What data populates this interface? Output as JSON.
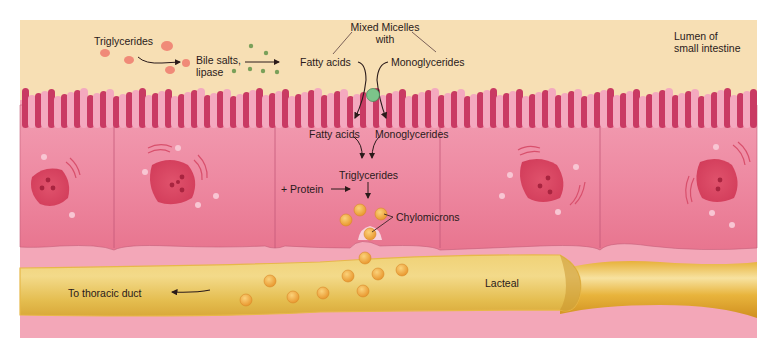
{
  "diagram": {
    "regions": {
      "lumen": {
        "label": "Lumen of\nsmall intestine",
        "line1": "Lumen of",
        "line2": "small intestine",
        "color": "#f7dfb4"
      },
      "epithelium": {
        "color": "#ef8aa0",
        "villi_dark": "#c93a63",
        "villi_light": "#f4a9bf"
      },
      "lamina": {
        "color": "#f3a7b8"
      },
      "lacteal": {
        "label": "Lacteal",
        "color": "#eccb62",
        "edge": "#d9a93a"
      }
    },
    "labels": {
      "triglycerides_lumen": "Triglycerides",
      "bile_salts_line1": "Bile salts,",
      "bile_salts_line2": "lipase",
      "mixed_micelles_line1": "Mixed Micelles",
      "mixed_micelles_line2": "with",
      "fatty_acids_lumen": "Fatty acids",
      "monoglycerides_lumen": "Monoglycerides",
      "fatty_acids_cell": "Fatty acids",
      "monoglycerides_cell": "Monoglycerides",
      "triglycerides_cell": "Triglycerides",
      "protein": "+ Protein",
      "chylomicrons": "Chylomicrons",
      "lacteal": "Lacteal",
      "to_thoracic_duct": "To thoracic duct"
    },
    "colors": {
      "fat_droplet": "#f08a78",
      "bile_dot": "#7aa05a",
      "micelle": "#7cc48a",
      "chylomicron": "#f2b347",
      "chylomicron_edge": "#d98a2a",
      "arrow": "#2a1a1a",
      "nucleus": "#d9425f"
    },
    "cells": [
      {
        "name": "cell-1",
        "x_start": 20,
        "x_end": 114
      },
      {
        "name": "cell-2",
        "x_start": 114,
        "x_end": 275
      },
      {
        "name": "cell-3",
        "x_start": 275,
        "x_end": 440
      },
      {
        "name": "cell-4",
        "x_start": 440,
        "x_end": 600
      },
      {
        "name": "cell-5",
        "x_start": 600,
        "x_end": 757
      }
    ]
  }
}
